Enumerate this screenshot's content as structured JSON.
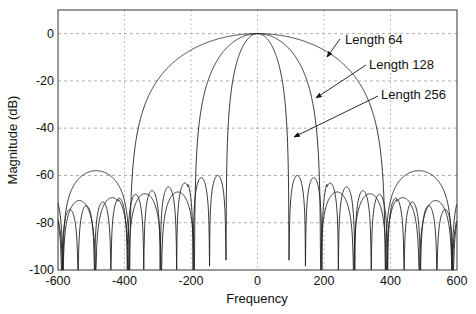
{
  "chart_data": {
    "type": "line",
    "title": "",
    "xlabel": "Frequency",
    "ylabel": "Magnitude (dB)",
    "xlim": [
      -600,
      600
    ],
    "ylim": [
      -100,
      10
    ],
    "xticks": [
      -600,
      -400,
      -200,
      0,
      200,
      400,
      600
    ],
    "yticks": [
      0,
      -20,
      -40,
      -60,
      -80,
      -100
    ],
    "grid": true,
    "legend": "none (annotations with arrows)",
    "series": [
      {
        "name": "Length 64",
        "first_null": 385,
        "sidelobe_peak_db": -58,
        "sidelobe_decay_db_per_lobe": 1.5,
        "approx_points": [
          [
            -600,
            -60
          ],
          [
            -500,
            -86
          ],
          [
            -440,
            -59
          ],
          [
            -385,
            -100
          ],
          [
            -300,
            -42
          ],
          [
            -200,
            -14
          ],
          [
            -100,
            -3
          ],
          [
            0,
            0
          ],
          [
            100,
            -3
          ],
          [
            200,
            -14
          ],
          [
            300,
            -42
          ],
          [
            385,
            -100
          ],
          [
            440,
            -59
          ],
          [
            500,
            -86
          ],
          [
            600,
            -60
          ]
        ]
      },
      {
        "name": "Length 128",
        "first_null": 190,
        "sidelobe_peak_db": -67,
        "sidelobe_decay_db_per_lobe": 1.2,
        "approx_points": [
          [
            -600,
            -76
          ],
          [
            -560,
            -73
          ],
          [
            -500,
            -88
          ],
          [
            -400,
            -68
          ],
          [
            -300,
            -73
          ],
          [
            -190,
            -100
          ],
          [
            -100,
            -12
          ],
          [
            0,
            0
          ],
          [
            100,
            -12
          ],
          [
            190,
            -100
          ],
          [
            300,
            -73
          ],
          [
            400,
            -68
          ],
          [
            500,
            -88
          ],
          [
            600,
            -76
          ]
        ]
      },
      {
        "name": "Length 256",
        "first_null": 95,
        "sidelobe_peak_db": -60,
        "sidelobe_decay_db_per_lobe": 1.6,
        "approx_points": [
          [
            -600,
            -94
          ],
          [
            -400,
            -86
          ],
          [
            -200,
            -76
          ],
          [
            -110,
            -61
          ],
          [
            -95,
            -100
          ],
          [
            -50,
            -10
          ],
          [
            0,
            0
          ],
          [
            50,
            -10
          ],
          [
            95,
            -100
          ],
          [
            110,
            -61
          ],
          [
            200,
            -76
          ],
          [
            400,
            -86
          ],
          [
            600,
            -94
          ]
        ]
      }
    ],
    "annotations": [
      {
        "text": "Length 64",
        "arrow_to": [
          300,
          -10
        ]
      },
      {
        "text": "Length 128",
        "arrow_to": [
          200,
          -28
        ]
      },
      {
        "text": "Length 256",
        "arrow_to": [
          87,
          -44
        ]
      }
    ]
  },
  "axes": {
    "xlabel": "Frequency",
    "ylabel": "Magnitude (dB)",
    "xtick_labels": [
      "-600",
      "-400",
      "-200",
      "0",
      "200",
      "400",
      "600"
    ],
    "ytick_labels": [
      "0",
      "-20",
      "-40",
      "-60",
      "-80",
      "-100"
    ]
  },
  "annotations": {
    "a64": "Length 64",
    "a128": "Length 128",
    "a256": "Length 256"
  },
  "colors": {
    "line": "#222222",
    "grid": "#9a9a9a",
    "axis": "#333333"
  }
}
